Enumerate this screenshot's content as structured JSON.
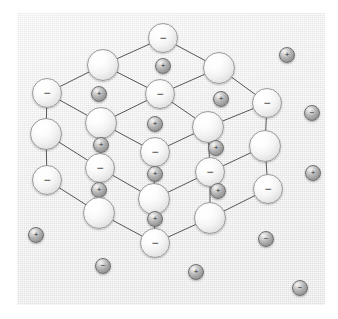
{
  "figure": {
    "panel_color": "#eeeeee",
    "page_color": "#ffffff",
    "bond_color": "#555555",
    "anion_color": "#f5f5f5",
    "cation_color": "#a8a8a8",
    "label_color": "#3a3a3a"
  },
  "legend": {
    "negative_symbol": "−",
    "positive_symbol": "+"
  },
  "lattice": {
    "bond_width": 1,
    "anion_radius": 15,
    "cation_radius": 8,
    "nodes": [
      {
        "id": "n01",
        "x": 163,
        "y": 38,
        "r": 15,
        "kind": "anion",
        "label": "−"
      },
      {
        "id": "n02",
        "x": 103,
        "y": 65,
        "r": 16,
        "kind": "anion",
        "label": ""
      },
      {
        "id": "n03",
        "x": 219,
        "y": 68,
        "r": 16,
        "kind": "anion",
        "label": ""
      },
      {
        "id": "n04",
        "x": 47,
        "y": 93,
        "r": 15,
        "kind": "anion",
        "label": "−"
      },
      {
        "id": "n05",
        "x": 160,
        "y": 94,
        "r": 15,
        "kind": "anion",
        "label": "−"
      },
      {
        "id": "n06",
        "x": 267,
        "y": 103,
        "r": 15,
        "kind": "anion",
        "label": "−"
      },
      {
        "id": "n07",
        "x": 101,
        "y": 123,
        "r": 16,
        "kind": "anion",
        "label": ""
      },
      {
        "id": "n08",
        "x": 208,
        "y": 127,
        "r": 16,
        "kind": "anion",
        "label": ""
      },
      {
        "id": "n09",
        "x": 46,
        "y": 134,
        "r": 16,
        "kind": "anion",
        "label": ""
      },
      {
        "id": "n10",
        "x": 155,
        "y": 152,
        "r": 15,
        "kind": "anion",
        "label": "−"
      },
      {
        "id": "n11",
        "x": 265,
        "y": 146,
        "r": 16,
        "kind": "anion",
        "label": ""
      },
      {
        "id": "n12",
        "x": 100,
        "y": 168,
        "r": 15,
        "kind": "anion",
        "label": "−"
      },
      {
        "id": "n13",
        "x": 210,
        "y": 172,
        "r": 15,
        "kind": "anion",
        "label": "−"
      },
      {
        "id": "n14",
        "x": 47,
        "y": 180,
        "r": 15,
        "kind": "anion",
        "label": "−"
      },
      {
        "id": "n15",
        "x": 268,
        "y": 189,
        "r": 15,
        "kind": "anion",
        "label": "−"
      },
      {
        "id": "n16",
        "x": 154,
        "y": 199,
        "r": 16,
        "kind": "anion",
        "label": ""
      },
      {
        "id": "n17",
        "x": 99,
        "y": 213,
        "r": 16,
        "kind": "anion",
        "label": ""
      },
      {
        "id": "n18",
        "x": 210,
        "y": 218,
        "r": 16,
        "kind": "anion",
        "label": ""
      },
      {
        "id": "n19",
        "x": 155,
        "y": 243,
        "r": 15,
        "kind": "anion",
        "label": "−"
      },
      {
        "id": "c01",
        "x": 163,
        "y": 66,
        "r": 8,
        "kind": "cation",
        "label": "+"
      },
      {
        "id": "c02",
        "x": 99,
        "y": 94,
        "r": 8,
        "kind": "cation",
        "label": "+"
      },
      {
        "id": "c03",
        "x": 221,
        "y": 99,
        "r": 8,
        "kind": "cation",
        "label": "+"
      },
      {
        "id": "c04",
        "x": 155,
        "y": 124,
        "r": 8,
        "kind": "cation",
        "label": "+"
      },
      {
        "id": "c05",
        "x": 101,
        "y": 145,
        "r": 8,
        "kind": "cation",
        "label": "+"
      },
      {
        "id": "c06",
        "x": 216,
        "y": 148,
        "r": 8,
        "kind": "cation",
        "label": "+"
      },
      {
        "id": "c07",
        "x": 155,
        "y": 174,
        "r": 8,
        "kind": "cation",
        "label": "+"
      },
      {
        "id": "c08",
        "x": 99,
        "y": 190,
        "r": 8,
        "kind": "cation",
        "label": "+"
      },
      {
        "id": "c09",
        "x": 218,
        "y": 191,
        "r": 8,
        "kind": "cation",
        "label": "+"
      },
      {
        "id": "c10",
        "x": 155,
        "y": 219,
        "r": 8,
        "kind": "cation",
        "label": "+"
      }
    ],
    "bonds": [
      [
        "n01",
        "n02"
      ],
      [
        "n01",
        "n03"
      ],
      [
        "n02",
        "n04"
      ],
      [
        "n02",
        "n05"
      ],
      [
        "n03",
        "n05"
      ],
      [
        "n03",
        "n06"
      ],
      [
        "n04",
        "n09"
      ],
      [
        "n04",
        "n07"
      ],
      [
        "n05",
        "n07"
      ],
      [
        "n05",
        "n08"
      ],
      [
        "n06",
        "n08"
      ],
      [
        "n06",
        "n11"
      ],
      [
        "n07",
        "n12"
      ],
      [
        "n07",
        "n10"
      ],
      [
        "n08",
        "n10"
      ],
      [
        "n08",
        "n13"
      ],
      [
        "n09",
        "n14"
      ],
      [
        "n09",
        "n12"
      ],
      [
        "n11",
        "n13"
      ],
      [
        "n11",
        "n15"
      ],
      [
        "n12",
        "n17"
      ],
      [
        "n12",
        "n16"
      ],
      [
        "n13",
        "n16"
      ],
      [
        "n13",
        "n18"
      ],
      [
        "n14",
        "n17"
      ],
      [
        "n15",
        "n18"
      ],
      [
        "n17",
        "n19"
      ],
      [
        "n18",
        "n19"
      ],
      [
        "n16",
        "n19"
      ],
      [
        "n10",
        "n16"
      ]
    ]
  },
  "free_ions": [
    {
      "id": "f01",
      "x": 287,
      "y": 55,
      "r": 8,
      "kind": "cation",
      "label": "+"
    },
    {
      "id": "f02",
      "x": 312,
      "y": 113,
      "r": 8,
      "kind": "cation",
      "label": "−"
    },
    {
      "id": "f03",
      "x": 313,
      "y": 173,
      "r": 8,
      "kind": "cation",
      "label": "+"
    },
    {
      "id": "f04",
      "x": 36,
      "y": 235,
      "r": 8,
      "kind": "cation",
      "label": "+"
    },
    {
      "id": "f05",
      "x": 266,
      "y": 239,
      "r": 8,
      "kind": "cation",
      "label": "−"
    },
    {
      "id": "f06",
      "x": 103,
      "y": 266,
      "r": 8,
      "kind": "cation",
      "label": "−"
    },
    {
      "id": "f07",
      "x": 196,
      "y": 272,
      "r": 8,
      "kind": "cation",
      "label": "+"
    },
    {
      "id": "f08",
      "x": 300,
      "y": 288,
      "r": 8,
      "kind": "cation",
      "label": "−"
    }
  ]
}
